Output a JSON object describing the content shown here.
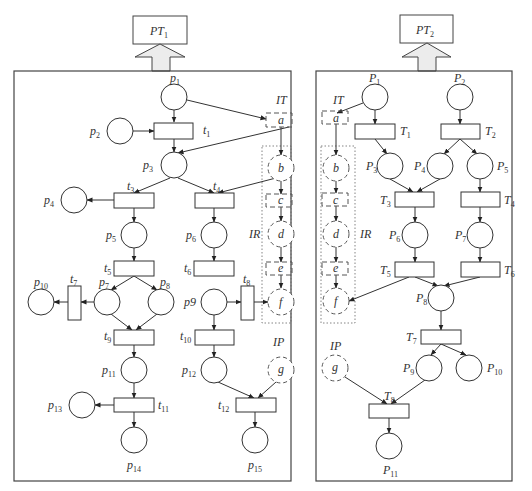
{
  "diagram": {
    "type": "petri-net-decomposition",
    "panels": [
      {
        "id": "left",
        "header": {
          "label": "PT",
          "sub": "1"
        },
        "interface_labels": {
          "transitions": "IT",
          "resources": "IR",
          "places": "IP"
        },
        "places": [
          {
            "id": "p1",
            "label": "p",
            "sub": "1"
          },
          {
            "id": "p2",
            "label": "p",
            "sub": "2"
          },
          {
            "id": "p3",
            "label": "p",
            "sub": "3"
          },
          {
            "id": "p4",
            "label": "p",
            "sub": "4"
          },
          {
            "id": "p5",
            "label": "p",
            "sub": "5"
          },
          {
            "id": "p6",
            "label": "p",
            "sub": "6"
          },
          {
            "id": "p7",
            "label": "p",
            "sub": "7"
          },
          {
            "id": "p8",
            "label": "p",
            "sub": "8"
          },
          {
            "id": "p9",
            "label": "p9",
            "sub": ""
          },
          {
            "id": "p10",
            "label": "p",
            "sub": "10"
          },
          {
            "id": "p11",
            "label": "p",
            "sub": "11"
          },
          {
            "id": "p12",
            "label": "p",
            "sub": "12"
          },
          {
            "id": "p13",
            "label": "p",
            "sub": "13"
          },
          {
            "id": "p14",
            "label": "p",
            "sub": "14"
          },
          {
            "id": "p15",
            "label": "p",
            "sub": "15"
          }
        ],
        "transitions": [
          {
            "id": "t1",
            "label": "t",
            "sub": "1"
          },
          {
            "id": "t3",
            "label": "t",
            "sub": "3"
          },
          {
            "id": "t4",
            "label": "t",
            "sub": "4"
          },
          {
            "id": "t5",
            "label": "t",
            "sub": "5"
          },
          {
            "id": "t6",
            "label": "t",
            "sub": "6"
          },
          {
            "id": "t7",
            "label": "t",
            "sub": "7"
          },
          {
            "id": "t8",
            "label": "t",
            "sub": "8"
          },
          {
            "id": "t9",
            "label": "t",
            "sub": "9"
          },
          {
            "id": "t10",
            "label": "t",
            "sub": "10"
          },
          {
            "id": "t11",
            "label": "t",
            "sub": "11"
          },
          {
            "id": "t12",
            "label": "t",
            "sub": "12"
          }
        ],
        "interface_nodes": [
          {
            "id": "a",
            "label": "a",
            "kind": "transition"
          },
          {
            "id": "b",
            "label": "b",
            "kind": "place"
          },
          {
            "id": "c",
            "label": "c",
            "kind": "transition"
          },
          {
            "id": "d",
            "label": "d",
            "kind": "place"
          },
          {
            "id": "e",
            "label": "e",
            "kind": "transition"
          },
          {
            "id": "f",
            "label": "f",
            "kind": "place"
          },
          {
            "id": "g",
            "label": "g",
            "kind": "place"
          }
        ]
      },
      {
        "id": "right",
        "header": {
          "label": "PT",
          "sub": "2"
        },
        "interface_labels": {
          "transitions": "IT",
          "resources": "IR",
          "places": "IP"
        },
        "places": [
          {
            "id": "P1",
            "label": "P",
            "sub": "1"
          },
          {
            "id": "P2",
            "label": "P",
            "sub": "2"
          },
          {
            "id": "P3",
            "label": "P",
            "sub": "3"
          },
          {
            "id": "P4",
            "label": "P",
            "sub": "4"
          },
          {
            "id": "P5",
            "label": "P",
            "sub": "5"
          },
          {
            "id": "P6",
            "label": "P",
            "sub": "6"
          },
          {
            "id": "P7",
            "label": "P",
            "sub": "7"
          },
          {
            "id": "P8",
            "label": "P",
            "sub": "8"
          },
          {
            "id": "P9",
            "label": "P",
            "sub": "9"
          },
          {
            "id": "P10",
            "label": "P",
            "sub": "10"
          },
          {
            "id": "P11",
            "label": "P",
            "sub": "11"
          }
        ],
        "transitions": [
          {
            "id": "T1",
            "label": "T",
            "sub": "1"
          },
          {
            "id": "T2",
            "label": "T",
            "sub": "2"
          },
          {
            "id": "T3",
            "label": "T",
            "sub": "3"
          },
          {
            "id": "T4",
            "label": "T",
            "sub": "4"
          },
          {
            "id": "T5",
            "label": "T",
            "sub": "5"
          },
          {
            "id": "T6",
            "label": "T",
            "sub": "6"
          },
          {
            "id": "T7",
            "label": "T",
            "sub": "7"
          },
          {
            "id": "T8",
            "label": "T",
            "sub": "8"
          }
        ],
        "interface_nodes": [
          {
            "id": "a",
            "label": "a",
            "kind": "transition"
          },
          {
            "id": "b",
            "label": "b",
            "kind": "place"
          },
          {
            "id": "c",
            "label": "c",
            "kind": "transition"
          },
          {
            "id": "d",
            "label": "d",
            "kind": "place"
          },
          {
            "id": "e",
            "label": "e",
            "kind": "transition"
          },
          {
            "id": "f",
            "label": "f",
            "kind": "place"
          },
          {
            "id": "g",
            "label": "g",
            "kind": "place"
          }
        ]
      }
    ]
  }
}
